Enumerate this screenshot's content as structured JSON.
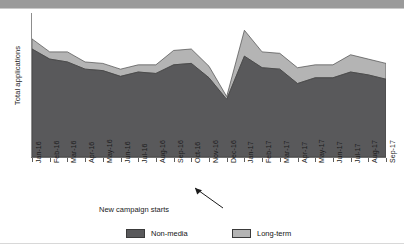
{
  "chart_data": {
    "type": "area",
    "stacked": true,
    "title": "",
    "xlabel": "",
    "ylabel": "Total applications",
    "grid": false,
    "legend_position": "bottom",
    "ylim": [
      0,
      100
    ],
    "y_ticks_shown": false,
    "categories": [
      "Jan-16",
      "Feb-16",
      "Mar-16",
      "Apr-16",
      "May-16",
      "Jun-16",
      "Jul-16",
      "Aug-16",
      "Sep-16",
      "Oct-16",
      "Nov-16",
      "Dec-16",
      "Jan-17",
      "Feb-17",
      "Mar-17",
      "Apr-17",
      "May-17",
      "Jun-17",
      "Jul-17",
      "Aug-17",
      "Sep-17"
    ],
    "series": [
      {
        "name": "Non-media",
        "color": "#59595b",
        "values": [
          75,
          68,
          66,
          61,
          60,
          56,
          59,
          58,
          64,
          65,
          55,
          40,
          70,
          62,
          61,
          51,
          55,
          55,
          59,
          57,
          54
        ]
      },
      {
        "name": "Long-term",
        "color": "#b4b4b4",
        "values": [
          7,
          5,
          7,
          5,
          5,
          5,
          5,
          6,
          10,
          10,
          8,
          2,
          18,
          11,
          11,
          11,
          9,
          9,
          12,
          11,
          11
        ]
      }
    ],
    "totals": [
      82,
      73,
      73,
      66,
      65,
      61,
      64,
      64,
      74,
      75,
      63,
      42,
      88,
      73,
      72,
      62,
      64,
      64,
      71,
      68,
      65
    ],
    "annotations": [
      {
        "text": "New campaign starts",
        "points_to_category": "Jan-17"
      }
    ]
  },
  "legend": {
    "items": [
      {
        "label": "Non-media",
        "color": "#59595b"
      },
      {
        "label": "Long-term",
        "color": "#b4b4b4"
      }
    ]
  },
  "axes": {
    "y_title": "Total applications"
  },
  "annotation": {
    "label": "New campaign starts"
  }
}
